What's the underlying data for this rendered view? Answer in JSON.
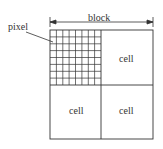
{
  "diagram": {
    "title_label": "block",
    "pointer_label": "pixel",
    "cells": [
      {
        "position": "top-left",
        "label": "",
        "content": "pixel-grid"
      },
      {
        "position": "top-right",
        "label": "cell"
      },
      {
        "position": "bottom-left",
        "label": "cell"
      },
      {
        "position": "bottom-right",
        "label": "cell"
      }
    ],
    "pixel_grid": {
      "rows": 8,
      "cols": 8
    },
    "colors": {
      "line": "#333333",
      "background": "#ffffff"
    }
  }
}
